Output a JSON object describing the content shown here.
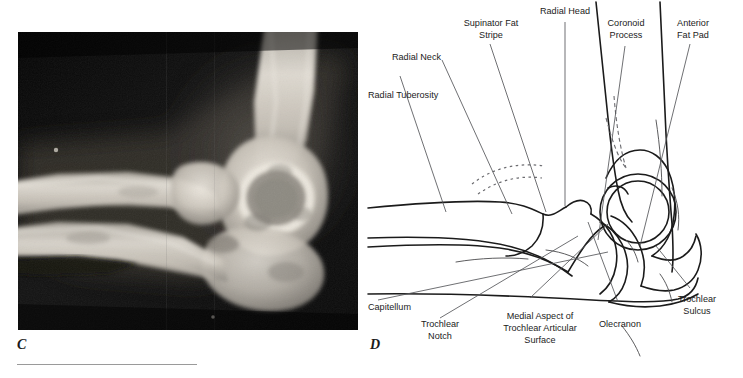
{
  "figure": {
    "panels": [
      {
        "letter": "C",
        "kind": "radiograph",
        "description": "Lateral elbow radiograph"
      },
      {
        "letter": "D",
        "kind": "line-diagram",
        "description": "Labeled line drawing of the lateral elbow"
      }
    ]
  },
  "xray": {
    "alt": "Lateral radiograph of the elbow showing distal humerus, radial head and olecranon",
    "background_color": "#0c0c0c",
    "bone_color": "#d9d4cc"
  },
  "diagram": {
    "line_color": "#1b1b1b",
    "leader_color": "#55565a",
    "labels": [
      {
        "id": "radial-tuberosity",
        "text": "Radial Tuberosity",
        "lines": [
          "Radial Tuberosity"
        ]
      },
      {
        "id": "radial-neck",
        "text": "Radial Neck",
        "lines": [
          "Radial Neck"
        ]
      },
      {
        "id": "supinator-fat-stripe",
        "text": "Supinator Fat Stripe",
        "lines": [
          "Supinator Fat",
          "Stripe"
        ]
      },
      {
        "id": "radial-head",
        "text": "Radial Head",
        "lines": [
          "Radial Head"
        ]
      },
      {
        "id": "coronoid-process",
        "text": "Coronoid Process",
        "lines": [
          "Coronoid",
          "Process"
        ]
      },
      {
        "id": "anterior-fat-pad",
        "text": "Anterior Fat Pad",
        "lines": [
          "Anterior",
          "Fat Pad"
        ]
      },
      {
        "id": "trochlear-sulcus",
        "text": "Trochlear Sulcus",
        "lines": [
          "Trochlear",
          "Sulcus"
        ]
      },
      {
        "id": "olecranon",
        "text": "Olecranon",
        "lines": [
          "Olecranon"
        ]
      },
      {
        "id": "medial-aspect-trochlear-articular-surface",
        "text": "Medial Aspect of Trochlear Articular Surface",
        "lines": [
          "Medial Aspect of",
          "Trochlear Articular",
          "Surface"
        ]
      },
      {
        "id": "trochlear-notch",
        "text": "Trochlear Notch",
        "lines": [
          "Trochlear",
          "Notch"
        ]
      },
      {
        "id": "capitellum",
        "text": "Capitellum",
        "lines": [
          "Capitellum"
        ]
      }
    ]
  }
}
